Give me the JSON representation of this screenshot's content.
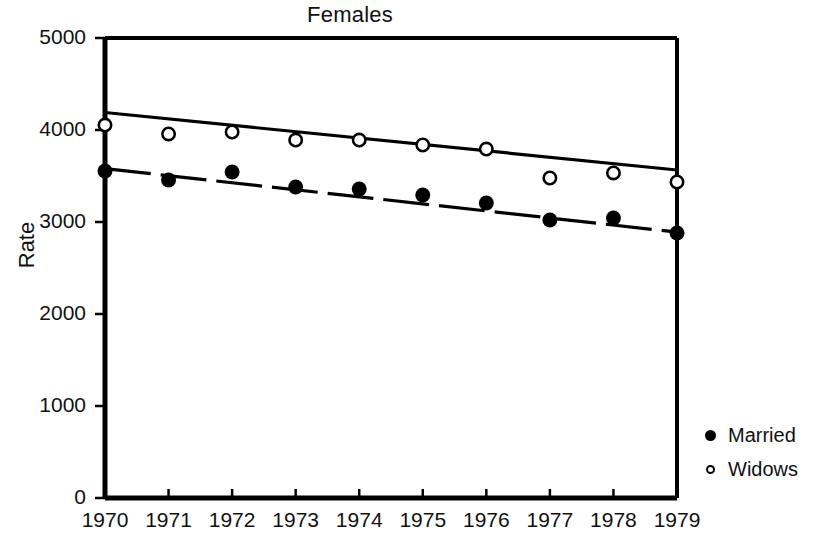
{
  "chart_data": {
    "type": "scatter",
    "title": "Females",
    "xlabel": "",
    "ylabel": "Rate",
    "x": [
      1970,
      1971,
      1972,
      1973,
      1974,
      1975,
      1976,
      1977,
      1978,
      1979
    ],
    "categories": [
      "1970",
      "1971",
      "1972",
      "1973",
      "1974",
      "1975",
      "1976",
      "1977",
      "1978",
      "1979"
    ],
    "xlim": [
      1970,
      1979
    ],
    "ylim": [
      0,
      5000
    ],
    "ytick_labels": [
      "0",
      "1000",
      "2000",
      "3000",
      "4000",
      "5000"
    ],
    "yticks": [
      0,
      1000,
      2000,
      3000,
      4000,
      5000
    ],
    "grid": false,
    "legend_position": "right",
    "series": [
      {
        "name": "Married",
        "marker": "filled-circle",
        "linestyle": "dashed",
        "color": "#000000",
        "values": [
          3554,
          3456,
          3543,
          3380,
          3359,
          3293,
          3207,
          3022,
          3043,
          2880
        ],
        "trend": {
          "start": 3580,
          "end": 2890
        }
      },
      {
        "name": "Widows",
        "marker": "open-circle",
        "linestyle": "solid",
        "color": "#000000",
        "values": [
          4054,
          3957,
          3978,
          3891,
          3891,
          3837,
          3793,
          3478,
          3533,
          3435
        ],
        "trend": {
          "start": 4190,
          "end": 3565
        }
      }
    ]
  },
  "legend": {
    "items": [
      {
        "label": "Married",
        "marker": "filled-circle"
      },
      {
        "label": "Widows",
        "marker": "open-circle"
      }
    ]
  }
}
